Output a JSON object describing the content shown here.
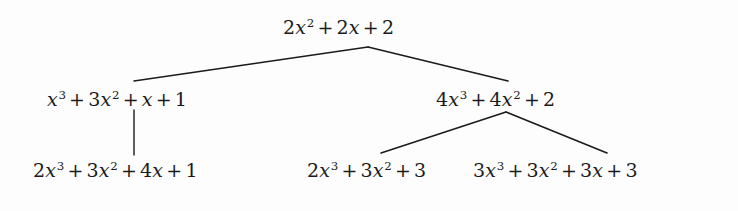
{
  "figure": {
    "kind": "expression-derivation-tree",
    "background_color": "#fdfdfd",
    "ink_color": "#1b1b1b",
    "nodes": {
      "root": {
        "id": "root",
        "text": "2x² + 2x + 2",
        "terms": [
          {
            "coefficient": "2",
            "variable": "x",
            "exponent": "2"
          },
          {
            "coefficient": "2",
            "variable": "x",
            "exponent": ""
          },
          {
            "coefficient": "2",
            "variable": "",
            "exponent": ""
          }
        ]
      },
      "left": {
        "id": "left",
        "text": "x³ + 3x² + x + 1",
        "terms": [
          {
            "coefficient": "",
            "variable": "x",
            "exponent": "3"
          },
          {
            "coefficient": "3",
            "variable": "x",
            "exponent": "2"
          },
          {
            "coefficient": "",
            "variable": "x",
            "exponent": ""
          },
          {
            "coefficient": "1",
            "variable": "",
            "exponent": ""
          }
        ]
      },
      "right": {
        "id": "right",
        "text": "4x³ + 4x² + 2",
        "terms": [
          {
            "coefficient": "4",
            "variable": "x",
            "exponent": "3"
          },
          {
            "coefficient": "4",
            "variable": "x",
            "exponent": "2"
          },
          {
            "coefficient": "2",
            "variable": "",
            "exponent": ""
          }
        ]
      },
      "leaf_1": {
        "id": "leaf_1",
        "text": "2x³ + 3x² + 4x + 1",
        "terms": [
          {
            "coefficient": "2",
            "variable": "x",
            "exponent": "3"
          },
          {
            "coefficient": "3",
            "variable": "x",
            "exponent": "2"
          },
          {
            "coefficient": "4",
            "variable": "x",
            "exponent": ""
          },
          {
            "coefficient": "1",
            "variable": "",
            "exponent": ""
          }
        ]
      },
      "leaf_2": {
        "id": "leaf_2",
        "text": "2x³ + 3x² + 3",
        "terms": [
          {
            "coefficient": "2",
            "variable": "x",
            "exponent": "3"
          },
          {
            "coefficient": "3",
            "variable": "x",
            "exponent": "2"
          },
          {
            "coefficient": "3",
            "variable": "",
            "exponent": ""
          }
        ]
      },
      "leaf_3": {
        "id": "leaf_3",
        "text": "3x³ + 3x² + 3x + 3",
        "terms": [
          {
            "coefficient": "3",
            "variable": "x",
            "exponent": "3"
          },
          {
            "coefficient": "3",
            "variable": "x",
            "exponent": "2"
          },
          {
            "coefficient": "3",
            "variable": "x",
            "exponent": ""
          },
          {
            "coefficient": "3",
            "variable": "",
            "exponent": ""
          }
        ]
      }
    },
    "edges": [
      {
        "id": "root-to-left",
        "from": "root",
        "to": "left",
        "x1": 368,
        "y1": 47,
        "x2": 134,
        "y2": 81
      },
      {
        "id": "root-to-right",
        "from": "root",
        "to": "right",
        "x1": 368,
        "y1": 47,
        "x2": 508,
        "y2": 81
      },
      {
        "id": "left-to-leaf-1",
        "from": "left",
        "to": "leaf_1",
        "x1": 134,
        "y1": 110,
        "x2": 134,
        "y2": 155
      },
      {
        "id": "right-to-leaf-2",
        "from": "right",
        "to": "leaf_2",
        "x1": 506,
        "y1": 112,
        "x2": 381,
        "y2": 153
      },
      {
        "id": "right-to-leaf-3",
        "from": "right",
        "to": "leaf_3",
        "x1": 506,
        "y1": 112,
        "x2": 607,
        "y2": 153
      }
    ],
    "operator": "+"
  }
}
